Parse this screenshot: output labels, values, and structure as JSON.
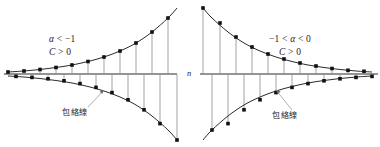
{
  "figure": {
    "width": 380,
    "height": 147,
    "axis_y": 74,
    "stroke_color": "#2b2b2f",
    "marker_color": "#111114",
    "stem_color": "#8b8b90",
    "leader_color": "#9a9a9f",
    "background": "#ffffff"
  },
  "labels": {
    "axis_n": "n",
    "left_cond_alpha_pre": "",
    "left_cond_alpha_var": "α",
    "left_cond_alpha_rest": " < −1",
    "left_cond_c_var": "C",
    "left_cond_c_rest": " > 0",
    "right_cond_pre": "−1 < ",
    "right_cond_alpha_var": "α",
    "right_cond_rest": " < 0",
    "right_cond_c_var": "C",
    "right_cond_c_rest": " > 0",
    "envelope_left": "包絡線",
    "envelope_right": "包絡線"
  },
  "chart_data": [
    {
      "type": "line",
      "id": "left-diverging-stem-plot",
      "title": "α < −1, C > 0",
      "xlabel": "n",
      "ylabel": "",
      "description": "Alternating geometric sequence C·α^n with |α|>1: stem plot of points that oscillate in sign and grow in magnitude, bounded by two mirror-image exponential envelope curves.",
      "grid": false,
      "legend": null,
      "axis_baseline": 0,
      "annotations": [
        "α < −1",
        "C > 0",
        "包絡線"
      ],
      "series": [
        {
          "name": "upper-envelope",
          "kind": "envelope",
          "points_px": [
            [
              8,
              72
            ],
            [
              24,
              71
            ],
            [
              40,
              69.5
            ],
            [
              56,
              67.5
            ],
            [
              72,
              65
            ],
            [
              88,
              61.5
            ],
            [
              104,
              57
            ],
            [
              120,
              51
            ],
            [
              136,
              43
            ],
            [
              152,
              32
            ],
            [
              168,
              18
            ],
            [
              177,
              8
            ]
          ]
        },
        {
          "name": "lower-envelope",
          "kind": "envelope",
          "points_px": [
            [
              8,
              76
            ],
            [
              24,
              77
            ],
            [
              40,
              78.5
            ],
            [
              56,
              80.5
            ],
            [
              72,
              83
            ],
            [
              88,
              86.5
            ],
            [
              104,
              91
            ],
            [
              120,
              97
            ],
            [
              136,
              105
            ],
            [
              152,
              116
            ],
            [
              168,
              130
            ],
            [
              177,
              140
            ]
          ]
        },
        {
          "name": "sequence-terms",
          "kind": "stem",
          "points_px": [
            [
              8,
              72
            ],
            [
              16,
              76.4
            ],
            [
              24,
              71
            ],
            [
              32,
              77.4
            ],
            [
              40,
              69.5
            ],
            [
              48,
              78.8
            ],
            [
              56,
              67.5
            ],
            [
              64,
              80.8
            ],
            [
              72,
              65
            ],
            [
              80,
              83.6
            ],
            [
              88,
              61.5
            ],
            [
              96,
              87.4
            ],
            [
              104,
              57
            ],
            [
              112,
              92.6
            ],
            [
              120,
              51
            ],
            [
              128,
              99.8
            ],
            [
              136,
              43
            ],
            [
              144,
              109.8
            ],
            [
              152,
              32
            ],
            [
              160,
              123.6
            ],
            [
              168,
              18
            ],
            [
              177,
              140
            ]
          ]
        }
      ]
    },
    {
      "type": "line",
      "id": "right-converging-stem-plot",
      "title": "−1 < α < 0, C > 0",
      "xlabel": "n",
      "ylabel": "",
      "description": "Alternating geometric sequence C·α^n with |α|<1: stem plot of points that oscillate in sign and decay in magnitude toward zero, bounded by two mirror-image decaying envelope curves.",
      "grid": false,
      "legend": null,
      "axis_baseline": 0,
      "annotations": [
        "−1 < α < 0",
        "C > 0",
        "包絡線"
      ],
      "series": [
        {
          "name": "upper-envelope",
          "kind": "envelope",
          "points_px": [
            [
              203,
              8
            ],
            [
              212,
              18
            ],
            [
              228,
              32
            ],
            [
              244,
              43
            ],
            [
              260,
              51
            ],
            [
              276,
              57
            ],
            [
              292,
              61.5
            ],
            [
              308,
              65
            ],
            [
              324,
              67.5
            ],
            [
              340,
              69.5
            ],
            [
              356,
              71
            ],
            [
              372,
              72
            ]
          ]
        },
        {
          "name": "lower-envelope",
          "kind": "envelope",
          "points_px": [
            [
              203,
              140
            ],
            [
              212,
              130
            ],
            [
              228,
              116
            ],
            [
              244,
              105
            ],
            [
              260,
              97
            ],
            [
              276,
              91
            ],
            [
              292,
              86.5
            ],
            [
              308,
              83
            ],
            [
              324,
              80.5
            ],
            [
              340,
              78.5
            ],
            [
              356,
              77
            ],
            [
              372,
              76
            ]
          ]
        },
        {
          "name": "sequence-terms",
          "kind": "stem",
          "points_px": [
            [
              203,
              8
            ],
            [
              212,
              130
            ],
            [
              220,
              23
            ],
            [
              228,
              123.6
            ],
            [
              236,
              37
            ],
            [
              244,
              109.8
            ],
            [
              252,
              47
            ],
            [
              260,
              99.8
            ],
            [
              268,
              54
            ],
            [
              276,
              92.6
            ],
            [
              284,
              59
            ],
            [
              292,
              87.4
            ],
            [
              300,
              63
            ],
            [
              308,
              83.6
            ],
            [
              316,
              66
            ],
            [
              324,
              80.8
            ],
            [
              332,
              68.5
            ],
            [
              340,
              78.8
            ],
            [
              348,
              70.3
            ],
            [
              356,
              77.4
            ],
            [
              364,
              71.3
            ],
            [
              372,
              76.4
            ]
          ]
        }
      ]
    }
  ]
}
